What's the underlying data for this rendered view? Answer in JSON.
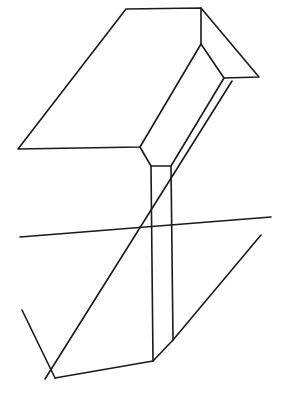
{
  "figure": {
    "stroke_color": "#1a1a1a",
    "background_color": "#ffffff"
  }
}
